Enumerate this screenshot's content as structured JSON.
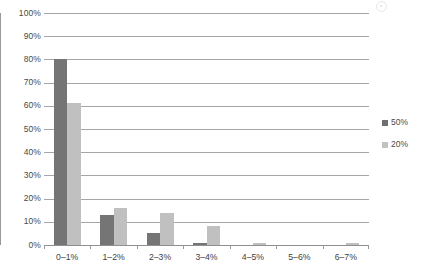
{
  "chart_data": {
    "type": "bar",
    "title": "",
    "subtitle": "",
    "xlabel": "",
    "ylabel": "",
    "categories": [
      "0–1%",
      "1–2%",
      "2–3%",
      "3–4%",
      "4–5%",
      "5–6%",
      "6–7%"
    ],
    "series": [
      {
        "name": "50%",
        "color": "#757575",
        "values": [
          80,
          13,
          5,
          1,
          0,
          0,
          0
        ]
      },
      {
        "name": "20%",
        "color": "#c0c0c0",
        "values": [
          61,
          16,
          14,
          8,
          1,
          0,
          1
        ]
      }
    ],
    "ylim": [
      0,
      100
    ],
    "ytick_labels": [
      "100%",
      "90%",
      "80%",
      "70%",
      "60%",
      "50%",
      "40%",
      "30%",
      "20%",
      "10%",
      "0%"
    ],
    "ytick_values": [
      100,
      90,
      80,
      70,
      60,
      50,
      40,
      30,
      20,
      10,
      0
    ],
    "grid": true,
    "grid_axis": "y",
    "legend": {
      "position": "right",
      "entries": [
        "50%",
        "20%"
      ]
    }
  },
  "colors": {
    "series_50": "#757575",
    "series_20": "#c0c0c0",
    "gridline": "#a6a6a6",
    "axis": "#9a9a9a",
    "text": "#3f3f3f",
    "background": "#ffffff"
  },
  "icons": {
    "legend_swatch_50": "square-swatch-icon",
    "legend_swatch_20": "square-swatch-icon",
    "artifact": "scan-speck-icon"
  }
}
